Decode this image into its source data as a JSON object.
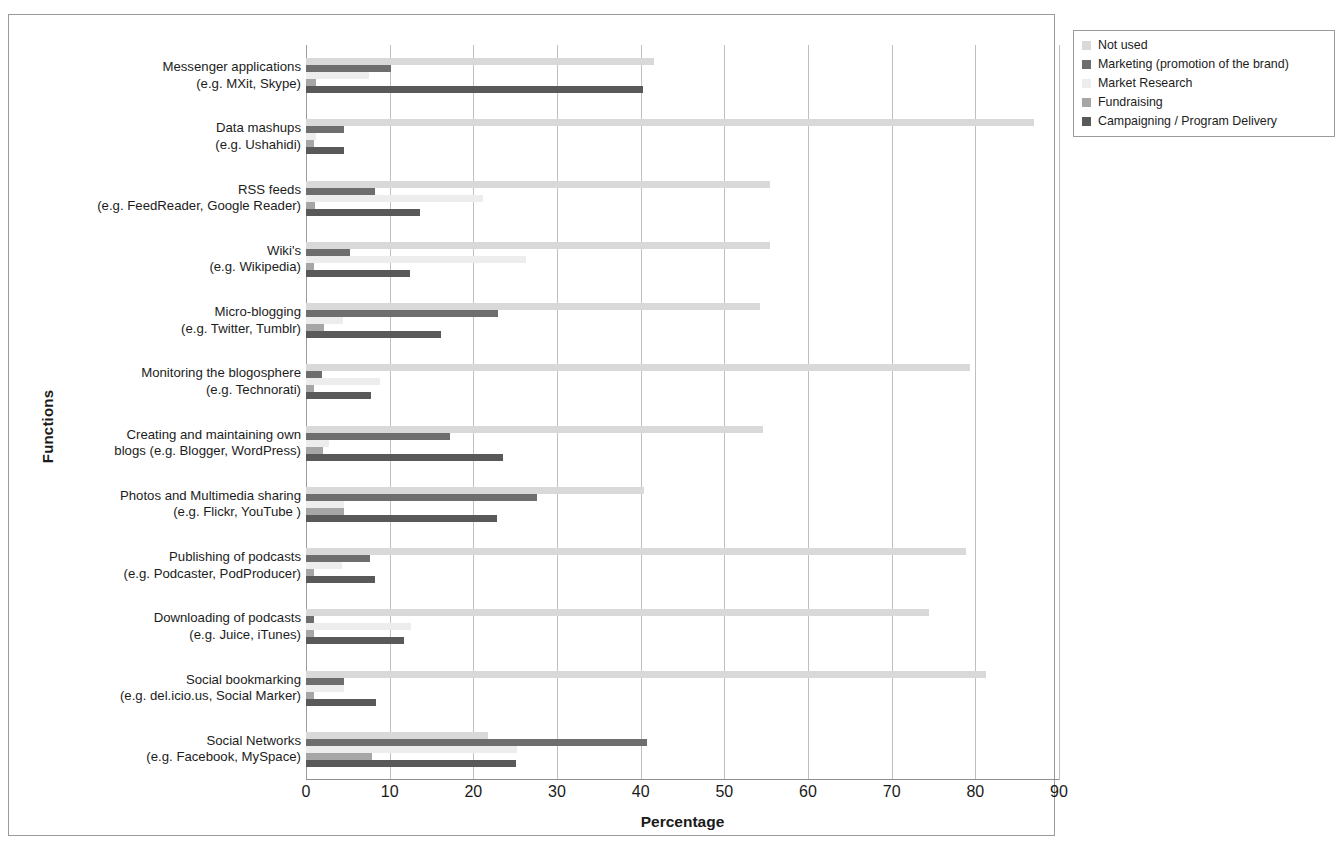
{
  "chart_data": {
    "type": "bar",
    "orientation": "horizontal",
    "title": "",
    "xlabel": "Percentage",
    "ylabel": "Functions",
    "xlim": [
      0,
      90
    ],
    "xticks": [
      0,
      10,
      20,
      30,
      40,
      50,
      60,
      70,
      80,
      90
    ],
    "grid": true,
    "legend_position": "top-right",
    "categories": [
      "Messenger applications (e.g. MXit, Skype)",
      "Data mashups (e.g. Ushahidi)",
      "RSS feeds (e.g. FeedReader, Google Reader)",
      "Wiki's (e.g. Wikipedia)",
      "Micro-blogging (e.g. Twitter, Tumblr)",
      "Monitoring the blogosphere (e.g. Technorati)",
      "Creating and maintaining own blogs (e.g. Blogger, WordPress)",
      "Photos and Multimedia sharing (e.g. Flickr, YouTube )",
      "Publishing of podcasts (e.g. Podcaster, PodProducer)",
      "Downloading of podcasts (e.g. Juice, iTunes)",
      "Social bookmarking (e.g. del.icio.us, Social Marker)",
      "Social Networks (e.g. Facebook, MySpace)"
    ],
    "category_lines": [
      [
        "Messenger applications",
        "(e.g. MXit, Skype)"
      ],
      [
        "Data mashups",
        "(e.g. Ushahidi)"
      ],
      [
        "RSS feeds",
        "(e.g. FeedReader, Google Reader)"
      ],
      [
        "Wiki's",
        "(e.g. Wikipedia)"
      ],
      [
        "Micro-blogging",
        "(e.g. Twitter, Tumblr)"
      ],
      [
        "Monitoring the blogosphere",
        "(e.g. Technorati)"
      ],
      [
        "Creating and maintaining own",
        "blogs (e.g. Blogger, WordPress)"
      ],
      [
        "Photos and Multimedia sharing",
        "(e.g. Flickr, YouTube )"
      ],
      [
        "Publishing of podcasts",
        "(e.g. Podcaster, PodProducer)"
      ],
      [
        "Downloading of podcasts",
        "(e.g. Juice, iTunes)"
      ],
      [
        "Social bookmarking",
        "(e.g. del.icio.us, Social Marker)"
      ],
      [
        "Social Networks",
        "(e.g. Facebook, MySpace)"
      ]
    ],
    "series": [
      {
        "name": "Not used",
        "color": "#d9d9d9",
        "values": [
          41.6,
          87.0,
          55.5,
          55.5,
          54.3,
          79.4,
          54.6,
          40.4,
          78.9,
          74.5,
          81.3,
          21.8
        ]
      },
      {
        "name": "Marketing (promotion of the brand)",
        "color": "#6e6e6e",
        "values": [
          10.2,
          4.6,
          8.2,
          5.3,
          23.0,
          1.9,
          17.2,
          27.6,
          7.6,
          0.9,
          4.6,
          40.8
        ]
      },
      {
        "name": "Market Research",
        "color": "#ededed",
        "values": [
          7.5,
          1.2,
          21.2,
          26.3,
          4.4,
          8.8,
          2.8,
          4.5,
          4.3,
          12.5,
          4.6,
          25.2
        ]
      },
      {
        "name": "Fundraising",
        "color": "#a6a6a6",
        "values": [
          1.2,
          0.9,
          1.1,
          0.9,
          2.2,
          0.9,
          2.0,
          4.5,
          1.0,
          0.9,
          0.9,
          7.9
        ]
      },
      {
        "name": "Campaigning / Program Delivery",
        "color": "#595959",
        "values": [
          40.3,
          4.6,
          13.6,
          12.4,
          16.1,
          7.8,
          23.6,
          22.8,
          8.2,
          11.7,
          8.4,
          25.1
        ]
      }
    ]
  },
  "axis": {
    "xlabel": "Percentage",
    "ylabel": "Functions"
  }
}
